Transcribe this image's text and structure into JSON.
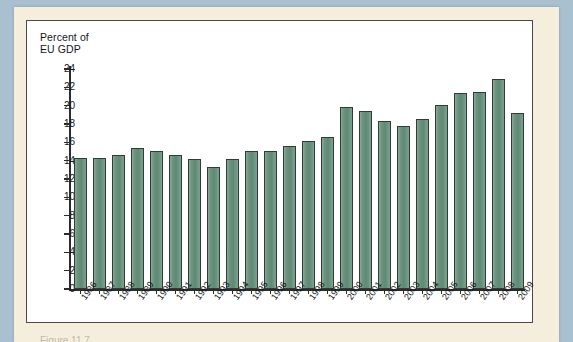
{
  "colors": {
    "scan_background": "#a9c0d1",
    "paper": "#f6eedc",
    "plot_background": "#ffffff",
    "bar_fill": "#6e947f",
    "bar_outline": "#2f3d36",
    "axis": "#2c2c2c",
    "text": "#15171a"
  },
  "chart_data": {
    "type": "bar",
    "title": "",
    "ylabel": "Percent of\nEU GDP",
    "xlabel": "",
    "ylim": [
      0,
      24
    ],
    "yticks": [
      0,
      2,
      4,
      6,
      8,
      10,
      12,
      14,
      16,
      18,
      20,
      22,
      24
    ],
    "grid": false,
    "legend": null,
    "categories": [
      "1986",
      "1987",
      "1988",
      "1989",
      "1990",
      "1991",
      "1992",
      "1993",
      "1994",
      "1995",
      "1996",
      "1997",
      "1998",
      "1999",
      "2000",
      "2001",
      "2002",
      "2003",
      "2004",
      "2005",
      "2006",
      "2007",
      "2008",
      "2009"
    ],
    "values": [
      14.3,
      14.3,
      14.6,
      15.4,
      15.1,
      14.6,
      14.2,
      13.3,
      14.2,
      15.1,
      15.1,
      15.6,
      16.1,
      16.6,
      19.9,
      19.4,
      18.3,
      17.8,
      18.6,
      20.1,
      21.4,
      21.5,
      22.9,
      19.2
    ]
  },
  "caption": {
    "partial_text": "Figure 11.7"
  }
}
